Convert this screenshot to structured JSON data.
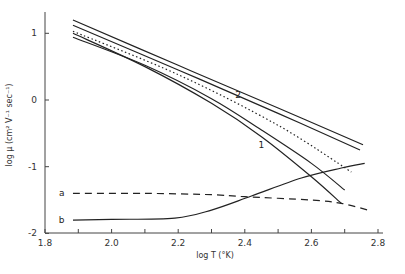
{
  "chart_data": {
    "type": "line",
    "title": "",
    "xlabel": "log T  (°K)",
    "ylabel": "log μ  (cm² V⁻¹ sec⁻¹)",
    "xlim": [
      1.8,
      2.8
    ],
    "ylim": [
      -2,
      1.3
    ],
    "grid": false,
    "x_ticks": [
      1.8,
      1.9,
      2.0,
      2.1,
      2.2,
      2.3,
      2.4,
      2.5,
      2.6,
      2.7,
      2.8
    ],
    "x_tick_labels": [
      {
        "value": 1.8,
        "label": "1.8"
      },
      {
        "value": 2.0,
        "label": "2.0"
      },
      {
        "value": 2.2,
        "label": "2.2"
      },
      {
        "value": 2.4,
        "label": "2.4"
      },
      {
        "value": 2.6,
        "label": "2.6"
      },
      {
        "value": 2.8,
        "label": "2.8"
      }
    ],
    "y_tick_labels": [
      {
        "value": 1,
        "label": "1"
      },
      {
        "value": 0,
        "label": "0"
      },
      {
        "value": -1,
        "label": "-1"
      },
      {
        "value": -2,
        "label": "-2"
      }
    ],
    "series": [
      {
        "name": "2 (upper)",
        "style": "solid",
        "x": [
          1.884,
          2.2,
          2.5,
          2.755
        ],
        "y": [
          1.2,
          0.52,
          -0.12,
          -0.67
        ]
      },
      {
        "name": "2 (lower)",
        "style": "solid",
        "x": [
          1.884,
          2.2,
          2.5,
          2.746
        ],
        "y": [
          1.12,
          0.45,
          -0.2,
          -0.75
        ]
      },
      {
        "name": "1 (upper)",
        "style": "solid",
        "x": [
          1.884,
          2.1,
          2.3,
          2.45,
          2.6,
          2.7
        ],
        "y": [
          0.94,
          0.52,
          0.02,
          -0.45,
          -0.95,
          -1.35
        ]
      },
      {
        "name": "1 (lower)",
        "style": "solid",
        "x": [
          1.884,
          2.1,
          2.3,
          2.45,
          2.6,
          2.69
        ],
        "y": [
          1.0,
          0.5,
          -0.05,
          -0.55,
          -1.15,
          -1.55
        ]
      },
      {
        "name": "dotted",
        "style": "dotted",
        "x": [
          1.884,
          2.2,
          2.5,
          2.72
        ],
        "y": [
          1.03,
          0.38,
          -0.38,
          -1.08
        ]
      },
      {
        "name": "a",
        "style": "dashed",
        "x": [
          1.884,
          2.1,
          2.3,
          2.4,
          2.6,
          2.69,
          2.77
        ],
        "y": [
          -1.4,
          -1.4,
          -1.42,
          -1.45,
          -1.5,
          -1.55,
          -1.65
        ]
      },
      {
        "name": "b",
        "style": "solid",
        "x": [
          1.884,
          2.0,
          2.19,
          2.3,
          2.42,
          2.57,
          2.69,
          2.76
        ],
        "y": [
          -1.8,
          -1.79,
          -1.77,
          -1.65,
          -1.44,
          -1.17,
          -1.02,
          -0.95
        ]
      }
    ],
    "annotations": [
      {
        "text": "2",
        "x": 2.38,
        "y": 0.08
      },
      {
        "text": "1",
        "x": 2.45,
        "y": -0.68
      },
      {
        "text": "a",
        "x": 1.85,
        "y": -1.4
      },
      {
        "text": "b",
        "x": 1.85,
        "y": -1.8
      }
    ]
  }
}
